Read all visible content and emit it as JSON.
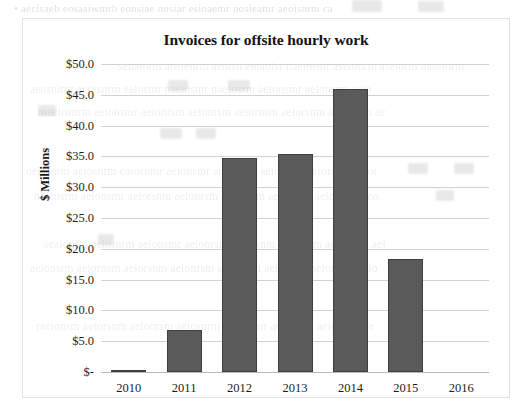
{
  "chart_data": {
    "type": "bar",
    "title": "Invoices for offsite hourly work",
    "xlabel": "",
    "ylabel": "$ Millions",
    "categories": [
      "2010",
      "2011",
      "2012",
      "2013",
      "2014",
      "2015",
      "2016"
    ],
    "values": [
      0.3,
      6.8,
      34.7,
      35.4,
      45.9,
      18.4,
      0
    ],
    "series": [
      {
        "name": "Invoices",
        "values": [
          0.3,
          6.8,
          34.7,
          35.4,
          45.9,
          18.4,
          0
        ]
      }
    ],
    "ylim": [
      0,
      50
    ],
    "ytick_values": [
      0,
      5,
      10,
      15,
      20,
      25,
      30,
      35,
      40,
      45,
      50
    ],
    "ytick_labels": [
      "$-",
      "$5.0",
      "$10.0",
      "$15.0",
      "$20.0",
      "$25.0",
      "$30.0",
      "$35.0",
      "$40.0",
      "$45.0",
      "$50.0"
    ],
    "grid": true,
    "legend": false,
    "legend_position": "none",
    "bar_color": "#5a5a5a",
    "bar_border_color": "#3f3f3f",
    "gridline_color": "#d2d2d2",
    "plot_background": "#ffffff",
    "chart_border_color": "#e2e2e2"
  },
  "background_bleed": {
    "note": "faint illegible scanned-page text showing through from the reverse side",
    "lines": [
      "• aecisaeb eosasiwmrb eonsiae nosiar esioaemr nosieamr aeoisnrm ca",
      "senaiorm aosienrm aeoisn emaoisr naeiosmr aseionrm aseiorm naseiorm",
      "aeosnimr aeoisnrm eaiosmr naeiosmr naeiosrm aeionsmr aeionsrm aeio",
      "maeiosnrm aeionsmr aeionrsm aeionrsm aeiornsm aeiorsnm aeiornsm ae",
      "oeiasnrm aeiosnrm eaiosnmr aeionsmr aeionsrm aeiornsm aeiorsnm aeior",
      "naeiosrm aeionsmr aeiorsnm aeionrsm aeiornsm aeiorsnm aeiornsm aeo",
      "seaionrm aeiosnrm aeionsmr aeionrsm aeiorsnm aeiornsm aeiorsnm aei",
      "aeionsrm aeiornsm aeiorsnm aeionrsm aeiornsm aeiosnrm aeionsmr aeio",
      "raeionsm aeiorsnm aeiornsm aeiosnrm aeionsmr aeionrsm aeiornsm ae"
    ]
  }
}
